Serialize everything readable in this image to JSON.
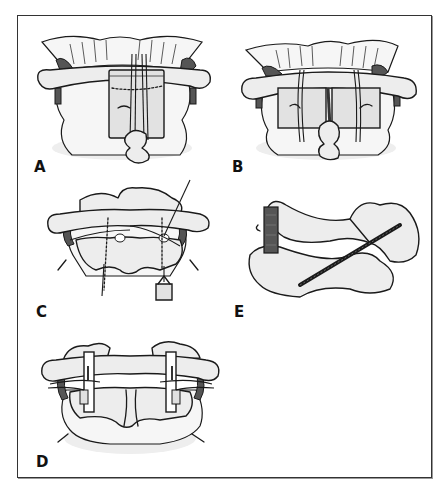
{
  "figure": {
    "panels": [
      {
        "id": "A",
        "label": "A",
        "description": "Single midline bone graft wired between C1 posterior arch and C2 spinous process"
      },
      {
        "id": "B",
        "label": "B",
        "description": "Two bilateral bone grafts secured with sublaminar wires"
      },
      {
        "id": "C",
        "label": "C",
        "description": "Passage of sublaminar wires/cables under C1 and C2 laminae with instrument"
      },
      {
        "id": "D",
        "label": "D",
        "description": "Interlaminar clamps applied bilaterally between C1 and C2"
      },
      {
        "id": "E",
        "label": "E",
        "description": "Lateral view of C1-C2 transarticular screw with posterior graft"
      }
    ]
  },
  "colors": {
    "border": "#333333",
    "ink": "#1a1a1a",
    "bone_fill": "#ededed",
    "ligament_dark": "#555555",
    "graft_fill": "#e2e2e2",
    "background": "#ffffff"
  }
}
